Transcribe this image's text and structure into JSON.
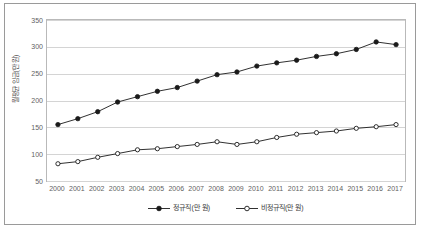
{
  "chart_data": {
    "type": "line",
    "title": "",
    "xlabel": "",
    "ylabel": "월평균 임금(만 원)",
    "x": [
      "2000",
      "2001",
      "2002",
      "2003",
      "2004",
      "2005",
      "2006",
      "2007",
      "2008",
      "2009",
      "2010",
      "2011",
      "2012",
      "2013",
      "2014",
      "2015",
      "2016",
      "2017"
    ],
    "categories": [
      "2000",
      "2001",
      "2002",
      "2003",
      "2004",
      "2005",
      "2006",
      "2007",
      "2008",
      "2009",
      "2010",
      "2011",
      "2012",
      "2013",
      "2014",
      "2015",
      "2016",
      "2017"
    ],
    "series": [
      {
        "name": "정규직(만 원)",
        "marker": "filled-circle",
        "color": "#1a1a1a",
        "values": [
          157,
          168,
          181,
          199,
          209,
          219,
          226,
          238,
          250,
          255,
          266,
          272,
          277,
          284,
          289,
          297,
          311,
          306
        ]
      },
      {
        "name": "비정규직(만 원)",
        "marker": "hollow-circle",
        "color": "#1a1a1a",
        "values": [
          84,
          88,
          96,
          103,
          110,
          112,
          116,
          120,
          125,
          120,
          125,
          133,
          139,
          142,
          145,
          150,
          153,
          157
        ]
      }
    ],
    "ylim": [
      50,
      350
    ],
    "yticks": [
      "50",
      "100",
      "150",
      "200",
      "250",
      "300",
      "350"
    ],
    "ytick_values": [
      50,
      100,
      150,
      200,
      250,
      300,
      350
    ],
    "grid": true,
    "grid_axis": "y",
    "legend_position": "bottom-center"
  },
  "axis": {
    "y_title": "월평균 임금(만 원)"
  },
  "legend": {
    "entries": [
      {
        "label": "정규직(만 원)"
      },
      {
        "label": "비정규직(만 원)"
      }
    ]
  }
}
